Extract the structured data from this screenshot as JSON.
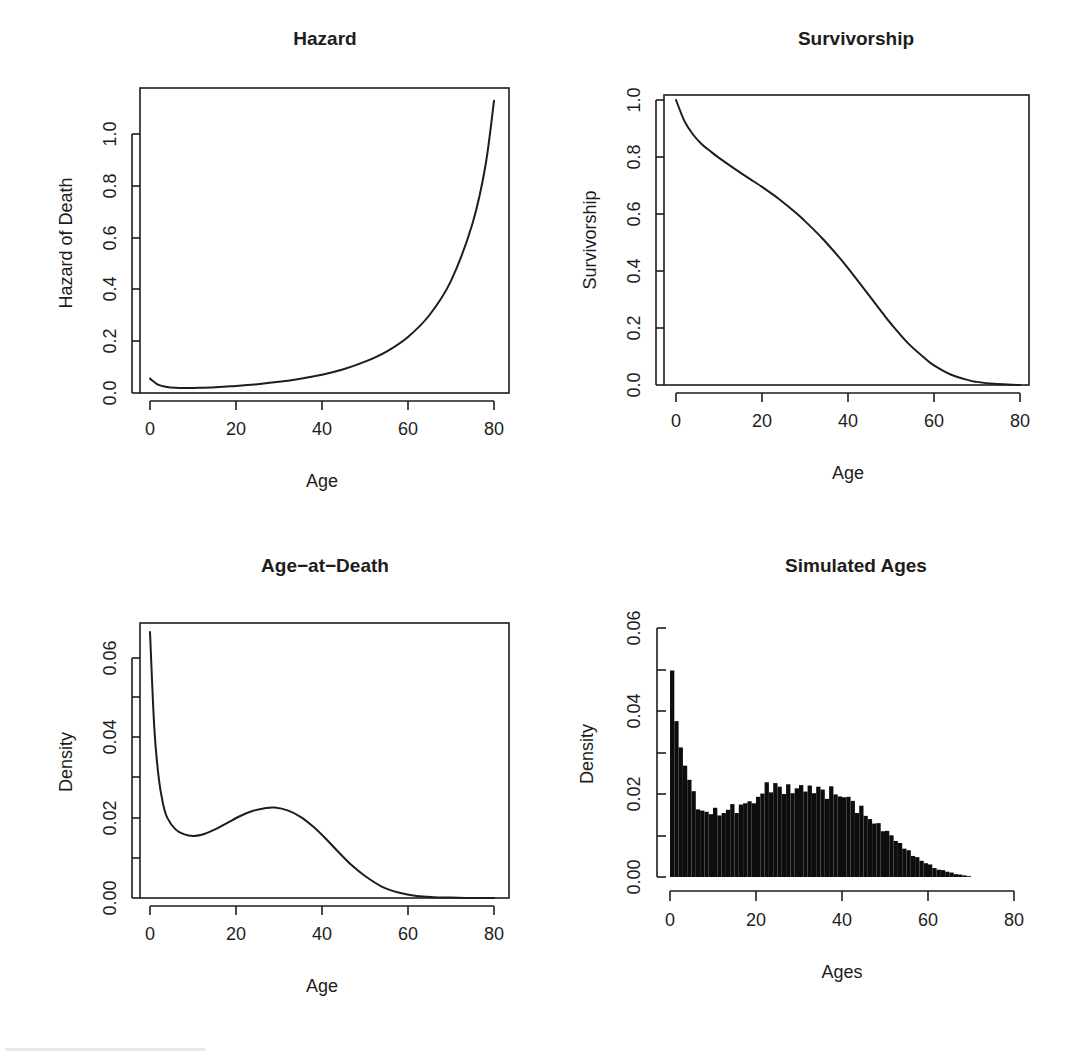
{
  "figure": {
    "layout": "2x2 grid of R base-graphics panels",
    "background_color": "#ffffff",
    "foreground_color": "#1d1d1d"
  },
  "chart_data": [
    {
      "type": "line",
      "panel": "top-left",
      "title": "Hazard",
      "xlabel": "Age",
      "ylabel": "Hazard of Death",
      "xlim": [
        0,
        80
      ],
      "ylim": [
        0.0,
        1.15
      ],
      "xticks": [
        0,
        20,
        40,
        60,
        80
      ],
      "xticklabels": [
        "0",
        "20",
        "40",
        "60",
        "80"
      ],
      "yticks": [
        0.0,
        0.2,
        0.4,
        0.6,
        0.8,
        1.0
      ],
      "yticklabels": [
        "0.0",
        "0.2",
        "0.4",
        "0.6",
        "0.8",
        "1.0"
      ],
      "grid": false,
      "legend": null,
      "frame": "box",
      "x": [
        0,
        2,
        4,
        6,
        8,
        10,
        12,
        14,
        16,
        18,
        20,
        25,
        30,
        35,
        40,
        45,
        50,
        55,
        60,
        65,
        70,
        75,
        78,
        80
      ],
      "y": [
        0.055,
        0.031,
        0.023,
        0.02,
        0.019,
        0.019,
        0.02,
        0.021,
        0.023,
        0.025,
        0.027,
        0.034,
        0.043,
        0.055,
        0.07,
        0.091,
        0.12,
        0.159,
        0.215,
        0.299,
        0.43,
        0.65,
        0.87,
        1.12
      ]
    },
    {
      "type": "line",
      "panel": "top-right",
      "title": "Survivorship",
      "xlabel": "Age",
      "ylabel": "Survivorship",
      "xlim": [
        0,
        80
      ],
      "ylim": [
        0.0,
        1.0
      ],
      "xticks": [
        0,
        20,
        40,
        60,
        80
      ],
      "xticklabels": [
        "0",
        "20",
        "40",
        "60",
        "80"
      ],
      "yticks": [
        0.0,
        0.2,
        0.4,
        0.6,
        0.8,
        1.0
      ],
      "yticklabels": [
        "0.0",
        "0.2",
        "0.4",
        "0.6",
        "0.8",
        "1.0"
      ],
      "grid": false,
      "legend": null,
      "frame": "box",
      "x": [
        0,
        2,
        4,
        6,
        8,
        10,
        14,
        18,
        20,
        24,
        28,
        30,
        34,
        38,
        40,
        44,
        48,
        50,
        54,
        58,
        60,
        64,
        68,
        70,
        74,
        78,
        80
      ],
      "y": [
        1.0,
        0.925,
        0.878,
        0.845,
        0.82,
        0.797,
        0.755,
        0.715,
        0.695,
        0.652,
        0.603,
        0.575,
        0.515,
        0.447,
        0.41,
        0.332,
        0.253,
        0.215,
        0.146,
        0.092,
        0.069,
        0.036,
        0.017,
        0.011,
        0.004,
        0.001,
        0.0
      ]
    },
    {
      "type": "line",
      "panel": "bottom-left",
      "title": "Age−at−Death",
      "xlabel": "Age",
      "ylabel": "Density",
      "xlim": [
        0,
        80
      ],
      "ylim": [
        0.0,
        0.0665
      ],
      "xticks": [
        0,
        20,
        40,
        60,
        80
      ],
      "xticklabels": [
        "0",
        "20",
        "40",
        "60",
        "80"
      ],
      "yticks": [
        0.0,
        0.01,
        0.02,
        0.03,
        0.04,
        0.05,
        0.06
      ],
      "yticklabels": [
        "0.00",
        "",
        "0.02",
        "",
        "0.04",
        "",
        "0.06"
      ],
      "grid": false,
      "legend": null,
      "frame": "box",
      "x": [
        0,
        1,
        2,
        3,
        4,
        6,
        8,
        10,
        12,
        15,
        18,
        21,
        24,
        27,
        29,
        32,
        35,
        38,
        41,
        44,
        47,
        50,
        54,
        58,
        62,
        66,
        70,
        75,
        80
      ],
      "y": [
        0.0665,
        0.0425,
        0.0303,
        0.0237,
        0.0201,
        0.0171,
        0.0159,
        0.0155,
        0.0158,
        0.0171,
        0.0188,
        0.0205,
        0.0218,
        0.0225,
        0.0226,
        0.0219,
        0.0203,
        0.0178,
        0.0147,
        0.0113,
        0.0081,
        0.0055,
        0.0028,
        0.0013,
        0.0005,
        0.0002,
        0.0001,
        0.0,
        0.0
      ]
    },
    {
      "type": "bar",
      "panel": "bottom-right",
      "title": "Simulated Ages",
      "xlabel": "Ages",
      "ylabel": "Density",
      "xlim": [
        0,
        80
      ],
      "ylim": [
        0.0,
        0.0615
      ],
      "xticks": [
        0,
        20,
        40,
        60,
        80
      ],
      "xticklabels": [
        "0",
        "20",
        "40",
        "60",
        "80"
      ],
      "yticks": [
        0.0,
        0.01,
        0.02,
        0.03,
        0.04,
        0.05,
        0.06
      ],
      "yticklabels": [
        "0.00",
        "",
        "0.02",
        "",
        "0.04",
        "",
        "0.06"
      ],
      "grid": false,
      "legend": null,
      "frame": "L-shaped axes",
      "bin_width": 1,
      "bin_starts": [
        0,
        1,
        2,
        3,
        4,
        5,
        6,
        7,
        8,
        9,
        10,
        11,
        12,
        13,
        14,
        15,
        16,
        17,
        18,
        19,
        20,
        21,
        22,
        23,
        24,
        25,
        26,
        27,
        28,
        29,
        30,
        31,
        32,
        33,
        34,
        35,
        36,
        37,
        38,
        39,
        40,
        41,
        42,
        43,
        44,
        45,
        46,
        47,
        48,
        49,
        50,
        51,
        52,
        53,
        54,
        55,
        56,
        57,
        58,
        59,
        60,
        61,
        62,
        63,
        64,
        65,
        66,
        67,
        68,
        69
      ],
      "values": [
        0.051,
        0.0385,
        0.032,
        0.0275,
        0.024,
        0.0212,
        0.0167,
        0.0164,
        0.0161,
        0.0155,
        0.0171,
        0.0152,
        0.0158,
        0.0166,
        0.018,
        0.0158,
        0.0179,
        0.0182,
        0.0187,
        0.0182,
        0.0198,
        0.0206,
        0.0234,
        0.0209,
        0.0232,
        0.0223,
        0.0205,
        0.0229,
        0.0207,
        0.0219,
        0.0227,
        0.0211,
        0.0226,
        0.0207,
        0.0223,
        0.0216,
        0.0193,
        0.0224,
        0.0204,
        0.0199,
        0.0197,
        0.0198,
        0.0188,
        0.0158,
        0.0176,
        0.0151,
        0.0143,
        0.0132,
        0.0133,
        0.0113,
        0.0114,
        0.0103,
        0.0089,
        0.0084,
        0.007,
        0.0066,
        0.0052,
        0.0049,
        0.004,
        0.0034,
        0.0031,
        0.0022,
        0.0018,
        0.0017,
        0.0013,
        0.0011,
        0.0007,
        0.0006,
        0.0004,
        0.0002
      ]
    }
  ]
}
